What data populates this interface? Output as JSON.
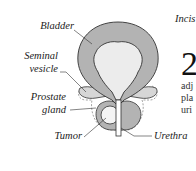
{
  "header": {
    "text": "Incis"
  },
  "labels": {
    "bladder": "Bladder",
    "seminal_1": "Seminal",
    "seminal_2": "vesicle",
    "prostate_1": "Prostate",
    "prostate_2": "gland",
    "tumor": "Tumor",
    "urethra": "Urethra"
  },
  "side_text": {
    "number": "2",
    "line1": "adj",
    "line2": "pla",
    "line3": "uri"
  },
  "colors": {
    "wall": "#b3b3b3",
    "lumen": "#ececec",
    "outline": "#333333"
  }
}
